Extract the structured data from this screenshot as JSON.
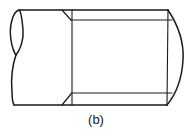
{
  "figure": {
    "caption": "(b)",
    "stroke_color": "#1a1a1a",
    "background": "#ffffff"
  }
}
